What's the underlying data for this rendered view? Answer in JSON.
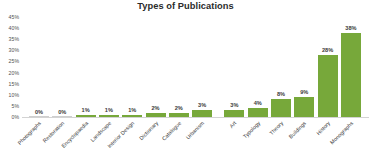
{
  "chart_data": {
    "type": "bar",
    "title": "Types of Publications",
    "xlabel": "",
    "ylabel": "",
    "ylim": [
      0,
      45
    ],
    "grid": false,
    "legend": "none",
    "unit": "%",
    "categories": [
      "Photographs",
      "Restoration",
      "Encyclopaedia",
      "Landscape",
      "Interior Design",
      "Dictionary",
      "Catalogue",
      "Urbanism",
      "Art",
      "Typology",
      "Theory",
      "Buildings",
      "History",
      "Monographs"
    ],
    "values": [
      0,
      0,
      1,
      1,
      1,
      2,
      2,
      3,
      3,
      4,
      8,
      9,
      28,
      38
    ],
    "value_labels": [
      "0%",
      "0%",
      "1%",
      "1%",
      "1%",
      "2%",
      "2%",
      "3%",
      "3%",
      "4%",
      "8%",
      "9%",
      "28%",
      "38%"
    ],
    "ytick_labels": [
      "45%",
      "40%",
      "35%",
      "30%",
      "25%",
      "20%",
      "15%",
      "10%",
      "5%",
      "0%"
    ],
    "ytick_values": [
      45,
      40,
      35,
      30,
      25,
      20,
      15,
      10,
      5,
      0
    ],
    "colors": {
      "bar": "#77a83a",
      "title": "#2b2b2b",
      "tick_label": "#4f4f4f",
      "value_label": "#3a3a3a",
      "category_label": "#3d3d3d",
      "axis_line": "#d3d3d3",
      "background": "#ffffff"
    }
  }
}
